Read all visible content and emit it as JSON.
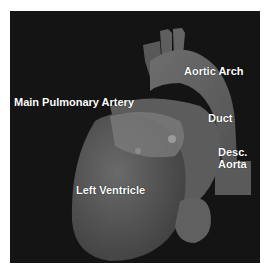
{
  "figure": {
    "background_color": "#141414",
    "labels": {
      "aortic_arch": "Aortic Arch",
      "main_pulmonary_artery": "Main Pulmonary Artery",
      "duct": "Duct",
      "desc_aorta_line1": "Desc.",
      "desc_aorta_line2": "Aorta",
      "left_ventricle": "Left Ventricle"
    }
  }
}
